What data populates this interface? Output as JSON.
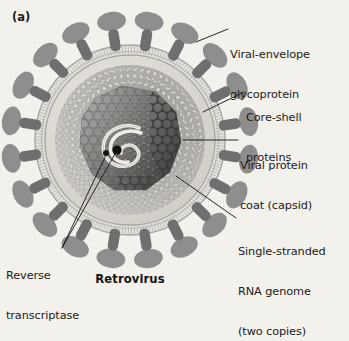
{
  "figure": {
    "panel_id": "(a)",
    "caption": "Retrovirus",
    "background_color": "#f3f1ec",
    "ink_color": "#1b1b1b"
  },
  "labels": {
    "envelope_glycoprotein": {
      "line1": "Viral-envelope",
      "line2": "glycoprotein"
    },
    "core_shell": {
      "line1": "Core-shell",
      "line2": "proteins"
    },
    "capsid": {
      "line1": "Viral protein",
      "line2": "coat (capsid)"
    },
    "rna": {
      "line1": "Single-stranded",
      "line2": "RNA genome",
      "line3": "(two copies)"
    },
    "reverse_transcriptase": {
      "line1": "Reverse",
      "line2": "transcriptase"
    }
  },
  "structure": {
    "center_x": 130,
    "center_y": 140,
    "envelope_outer_radius": 96,
    "envelope_inner_radius": 86,
    "core_shell_radius": 74,
    "capsid_radius": 52,
    "spike_count": 20,
    "colors": {
      "spike_head": "#8e8e8e",
      "spike_stalk": "#6f6f6f",
      "membrane_band": "#cfcdc8",
      "membrane_line": "#9a9a98",
      "core_shell_dot": "#b9b7b2",
      "capsid_light": "#9b9a97",
      "capsid_dark": "#3a3a3a",
      "rna_strand": "#ece9e3",
      "enzyme_dot": "#101010",
      "interior": "#dedbd5"
    }
  }
}
